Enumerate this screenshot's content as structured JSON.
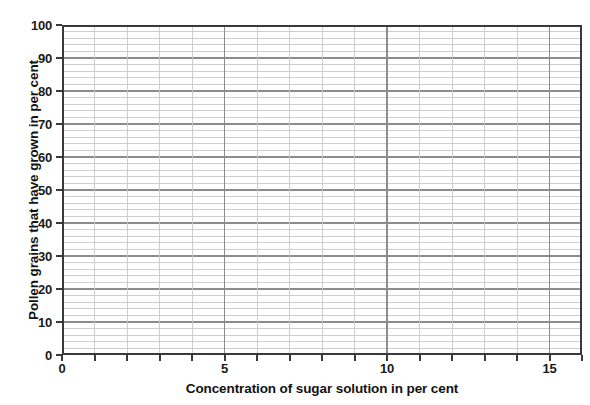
{
  "chart_data": {
    "type": "line",
    "title": "",
    "subtitle": "",
    "xlabel": "Concentration of sugar solution in per cent",
    "ylabel": "Pollen grains that have grown in per cent",
    "xlim": [
      0,
      16
    ],
    "ylim": [
      0,
      100
    ],
    "x_major_ticks": [
      0,
      1,
      2,
      3,
      4,
      5,
      6,
      7,
      8,
      9,
      10,
      11,
      12,
      13,
      14,
      15,
      16
    ],
    "x_tick_labels": [
      "0",
      "",
      "",
      "",
      "",
      "5",
      "",
      "",
      "",
      "",
      "10",
      "",
      "",
      "",
      "",
      "15",
      ""
    ],
    "y_major_ticks": [
      0,
      10,
      20,
      30,
      40,
      50,
      60,
      70,
      80,
      90,
      100
    ],
    "y_tick_labels": [
      "0",
      "10",
      "20",
      "30",
      "40",
      "50",
      "60",
      "70",
      "80",
      "90",
      "100"
    ],
    "y_minor_step": 2,
    "x_minor_step": 1,
    "grid": true,
    "grid_major_color": "#8c8c8c",
    "grid_minor_color": "#c9c9c9",
    "axis_color": "#3a3a3a",
    "background_color": "#ffffff",
    "legend": null,
    "legend_position": "none",
    "annotations": [],
    "series": [],
    "note": "Empty graph-paper grid; no data points are plotted."
  },
  "axes": {
    "x_title": "Concentration of sugar solution in per cent",
    "y_title": "Pollen grains that have grown in per cent"
  }
}
